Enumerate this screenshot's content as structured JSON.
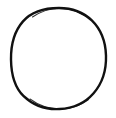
{
  "image": {
    "width": 116,
    "height": 118,
    "background_color": "#ffffff",
    "description": "Hand-drawn black circle outline on a white background",
    "caption": ""
  },
  "shapes": [
    {
      "name": "circle-outline",
      "type": "ellipse",
      "center_x": 59,
      "center_y": 58.5,
      "radius_x": 47.5,
      "radius_y": 50.5,
      "stroke_color": "#111111",
      "stroke_width": 2.4,
      "fill_color": "none",
      "bounds": {
        "left": 11,
        "top": 8,
        "right": 106,
        "bottom": 109
      }
    }
  ],
  "text_labels": []
}
